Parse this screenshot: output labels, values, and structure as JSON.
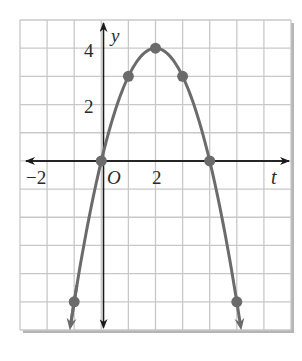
{
  "chart_data": {
    "type": "line",
    "title": "",
    "xlabel": "t",
    "ylabel": "y",
    "xlim": [
      -3,
      7
    ],
    "ylim": [
      -6,
      5
    ],
    "grid": true,
    "legend": null,
    "x_tick_labels": [
      {
        "value": -2,
        "label": "−2"
      },
      {
        "value": 2,
        "label": "2"
      }
    ],
    "y_tick_labels": [
      {
        "value": 2,
        "label": "2"
      },
      {
        "value": 4,
        "label": "4"
      }
    ],
    "origin_label": "O",
    "series": [
      {
        "name": "parabola",
        "equation": "y = -t^2 + 4t",
        "points": [
          {
            "t": -1,
            "y": -5
          },
          {
            "t": 0,
            "y": 0
          },
          {
            "t": 1,
            "y": 3
          },
          {
            "t": 2,
            "y": 4
          },
          {
            "t": 3,
            "y": 3
          },
          {
            "t": 4,
            "y": 0
          },
          {
            "t": 5,
            "y": -5
          }
        ],
        "arrows_at_ends": true
      }
    ],
    "colors": {
      "curve": "#6b6b6b",
      "points": "#6b6b6b",
      "grid": "#c8c8c8",
      "axes": "#1a1a1a",
      "frame_shadow": "#b5b5b5"
    }
  },
  "labels": {
    "x_axis": "t",
    "y_axis": "y",
    "origin": "O",
    "x_neg2": "−2",
    "x_2": "2",
    "y_2": "2",
    "y_4": "4"
  }
}
